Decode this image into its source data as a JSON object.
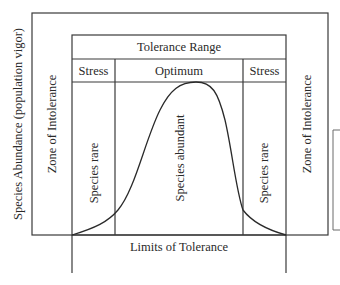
{
  "diagram": {
    "title": "Tolerance Range",
    "y_axis_label": "Species Abundance (population vigor)",
    "x_axis_label": "Limits of Tolerance",
    "zones": {
      "left_intolerance": "Zone of Intolerance",
      "right_intolerance": "Zone of Intolerance",
      "left_stress": "Stress",
      "optimum": "Optimum",
      "right_stress": "Stress"
    },
    "region_labels": {
      "left_rare": "Species rare",
      "center_abundant": "Species abundant",
      "right_rare": "Species rare"
    },
    "curve": {
      "type": "bell",
      "description": "Population abundance peaks in optimum zone and falls to zero at limits of tolerance"
    },
    "colors": {
      "line": "#3a3a3a",
      "background": "#ffffff"
    }
  }
}
